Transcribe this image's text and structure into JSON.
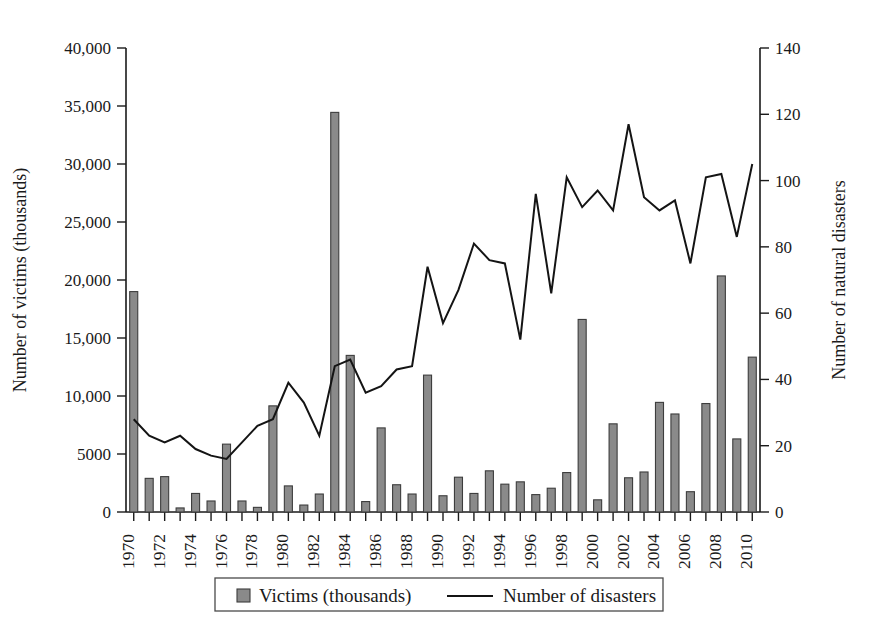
{
  "chart_data": {
    "type": "bar",
    "title": "",
    "subtitle": "",
    "xlabel": "",
    "ylabel": "Number of victims (thousands)",
    "y2label": "Number of natural disasters",
    "grid": false,
    "legend_position": "bottom",
    "ylim": [
      0,
      40000
    ],
    "y2lim": [
      0,
      140
    ],
    "xlim": [
      1970,
      2011
    ],
    "y_ticklabels": [
      "0",
      "5000",
      "10,000",
      "15,000",
      "20,000",
      "25,000",
      "30,000",
      "35,000",
      "40,000"
    ],
    "y_tickvalues": [
      0,
      5000,
      10000,
      15000,
      20000,
      25000,
      30000,
      35000,
      40000
    ],
    "y2_ticklabels": [
      "0",
      "20",
      "40",
      "60",
      "80",
      "100",
      "120",
      "140"
    ],
    "y2_tickvalues": [
      0,
      20,
      40,
      60,
      80,
      100,
      120,
      140
    ],
    "x_ticklabels": [
      "1970",
      "1972",
      "1974",
      "1976",
      "1978",
      "1980",
      "1982",
      "1984",
      "1986",
      "1988",
      "1990",
      "1992",
      "1994",
      "1996",
      "1998",
      "2000",
      "2002",
      "2004",
      "2006",
      "2008",
      "2010"
    ],
    "categories": [
      1970,
      1971,
      1972,
      1973,
      1974,
      1975,
      1976,
      1977,
      1978,
      1979,
      1980,
      1981,
      1982,
      1983,
      1984,
      1985,
      1986,
      1987,
      1988,
      1989,
      1990,
      1991,
      1992,
      1993,
      1994,
      1995,
      1996,
      1997,
      1998,
      1999,
      2000,
      2001,
      2002,
      2003,
      2004,
      2005,
      2006,
      2007,
      2008,
      2009,
      2010
    ],
    "series": [
      {
        "name": "Victims (thousands)",
        "type": "bar",
        "axis": "left",
        "color": "#8a8a8a",
        "values": [
          19000,
          2900,
          3050,
          350,
          1600,
          950,
          5850,
          950,
          400,
          9150,
          2250,
          600,
          1550,
          34450,
          13500,
          900,
          7250,
          2350,
          1550,
          11800,
          1400,
          3000,
          1600,
          3550,
          2400,
          2600,
          1500,
          2050,
          3400,
          16600,
          1050,
          7600,
          2950,
          3450,
          9450,
          8450,
          1750,
          9350,
          20350,
          6300,
          13350
        ]
      },
      {
        "name": "Number of disasters",
        "type": "line",
        "axis": "right",
        "color": "#141414",
        "values": [
          28,
          23,
          21,
          23,
          19,
          17,
          16,
          21,
          26,
          28,
          39,
          33,
          23,
          44,
          46,
          36,
          38,
          43,
          44,
          74,
          57,
          67,
          81,
          76,
          75,
          52,
          96,
          66,
          101,
          92,
          97,
          91,
          117,
          95,
          91,
          94,
          75,
          101,
          102,
          83,
          105
        ]
      }
    ],
    "legend": [
      {
        "label": "Victims (thousands)",
        "marker": "square",
        "color": "#8a8a8a"
      },
      {
        "label": "Number of disasters",
        "marker": "line",
        "color": "#141414"
      }
    ]
  }
}
